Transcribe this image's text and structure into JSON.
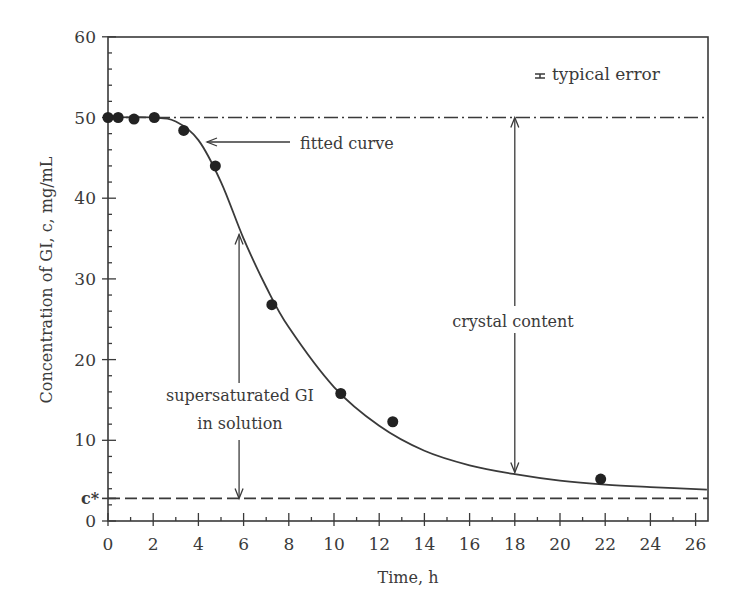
{
  "chart_data": {
    "type": "scatter",
    "title": "",
    "xlabel": "Time, h",
    "ylabel": "Concentration of GI, c, mg/mL",
    "xlim": [
      0,
      26.5
    ],
    "ylim": [
      0,
      60
    ],
    "x_ticks": [
      0,
      2,
      4,
      6,
      8,
      10,
      12,
      14,
      16,
      18,
      20,
      22,
      24,
      26
    ],
    "y_ticks": [
      0,
      10,
      20,
      30,
      40,
      50,
      60
    ],
    "grid": false,
    "series": [
      {
        "name": "measured",
        "marker": "filled-circle",
        "x": [
          0,
          0.45,
          1.15,
          2.05,
          3.35,
          4.75,
          7.25,
          10.3,
          12.6,
          21.8
        ],
        "y": [
          50,
          50,
          49.8,
          50,
          48.4,
          44,
          26.8,
          15.8,
          12.3,
          5.2
        ]
      },
      {
        "name": "fitted curve",
        "style": "solid-line",
        "x": [
          0,
          2,
          3,
          4,
          5,
          6,
          7,
          8,
          10,
          12,
          14,
          16,
          18,
          20,
          22,
          24,
          26.5
        ],
        "y": [
          50,
          50,
          49.5,
          47.2,
          42,
          35,
          29,
          24,
          16.6,
          11.8,
          8.7,
          6.9,
          5.8,
          5.0,
          4.5,
          4.2,
          3.9
        ]
      },
      {
        "name": "initial concentration",
        "style": "dash-dot-line",
        "y_const": 50
      },
      {
        "name": "c*",
        "style": "dashed-line",
        "y_const": 2.8
      }
    ],
    "annotations": [
      {
        "text": "fitted curve",
        "x": 7.5,
        "y": 45.5,
        "arrow_to": [
          4.4,
          45.5
        ]
      },
      {
        "text": "supersaturated GI",
        "x": 5.8,
        "y": 16.5
      },
      {
        "text": "in solution",
        "x": 5.8,
        "y": 13.0
      },
      {
        "text": "crystal content",
        "x": 18,
        "y": 24.5
      },
      {
        "text": "typical error",
        "x": 19.3,
        "y": 54.8
      },
      {
        "text": "c*",
        "axis": "y",
        "y": 2.8
      }
    ],
    "double_arrows": [
      {
        "name": "supersaturated-arrow",
        "x": 5.8,
        "y_from": 2.8,
        "y_to": 35.5
      },
      {
        "name": "crystal-content-arrow",
        "x": 18,
        "y_from": 6.0,
        "y_to": 50
      }
    ],
    "legend": {
      "position": "top-right",
      "entries": [
        "typical error"
      ]
    }
  },
  "labels": {
    "xlabel": "Time, h",
    "ylabel": "Concentration of GI, c, mg/mL",
    "cstar": "c*",
    "fitted": "fitted curve",
    "super1": "supersaturated GI",
    "super2": "in solution",
    "crystal": "crystal content",
    "error": "typical error"
  },
  "colors": {
    "ink": "#3a3a3a",
    "marker": "#222222",
    "background": "#ffffff"
  }
}
